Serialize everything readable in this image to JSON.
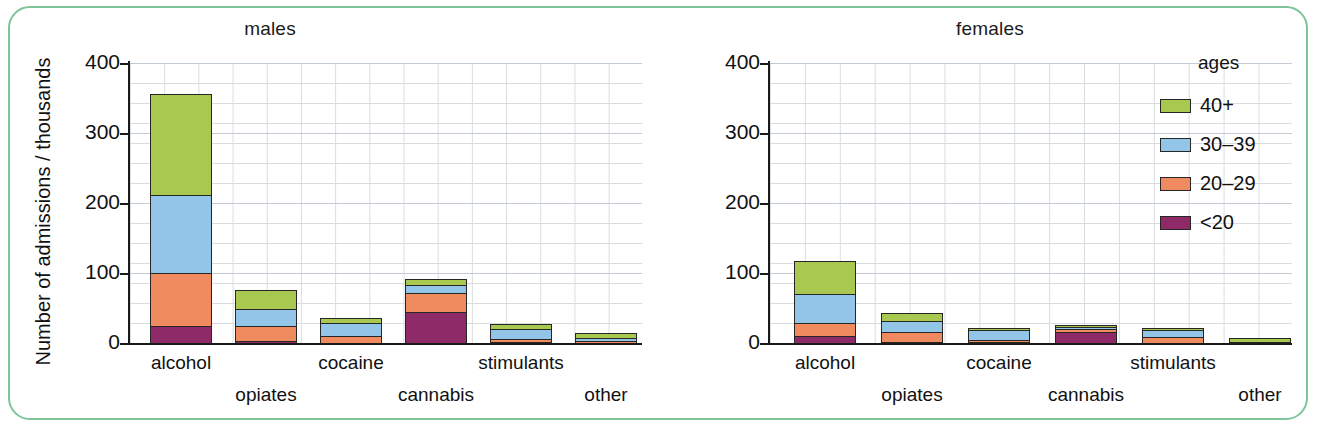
{
  "figure": {
    "y_axis_title": "Number of admissions / thousands",
    "panels": [
      {
        "key": "males",
        "title": "males"
      },
      {
        "key": "females",
        "title": "females"
      }
    ],
    "y_ticks": [
      "0",
      "100",
      "200",
      "300",
      "400"
    ],
    "categories": [
      "alcohol",
      "opiates",
      "cocaine",
      "cannabis",
      "stimulants",
      "other"
    ],
    "legend": {
      "title": "ages",
      "entries": [
        {
          "label": "40+",
          "color": "#a8c84f"
        },
        {
          "label": "30–39",
          "color": "#92c5e8"
        },
        {
          "label": "20–29",
          "color": "#ef8b5e"
        },
        {
          "label": "<20",
          "color": "#8e2a68"
        }
      ]
    },
    "frame_color": "#7ec49a",
    "grid_color": "#d9dde0",
    "major_grid_color": "#c3ccd4",
    "outline_color": "#262626"
  },
  "chart_data": {
    "type": "bar",
    "subtype": "stacked",
    "xlabel": "",
    "ylabel": "Number of admissions / thousands",
    "ylim": [
      0,
      400
    ],
    "yticks": [
      0,
      100,
      200,
      300,
      400
    ],
    "grid": true,
    "legend_position": "right",
    "legend_title": "ages",
    "categories": [
      "alcohol",
      "opiates",
      "cocaine",
      "cannabis",
      "stimulants",
      "other"
    ],
    "panels": [
      {
        "name": "males",
        "series": [
          {
            "name": "<20",
            "color": "#8e2a68",
            "values": [
              27,
              5,
              3,
              47,
              4,
              3
            ]
          },
          {
            "name": "20–29",
            "color": "#ef8b5e",
            "values": [
              78,
              24,
              11,
              29,
              7,
              5
            ]
          },
          {
            "name": "30–39",
            "color": "#92c5e8",
            "values": [
              113,
              27,
              22,
              14,
              16,
              6
            ]
          },
          {
            "name": "40+",
            "color": "#a8c84f",
            "values": [
              147,
              29,
              9,
              10,
              9,
              9
            ]
          }
        ],
        "totals": [
          365,
          85,
          45,
          100,
          36,
          23
        ]
      },
      {
        "name": "females",
        "series": [
          {
            "name": "<20",
            "color": "#8e2a68",
            "values": [
              13,
              4,
              4,
              18,
              3,
              3
            ]
          },
          {
            "name": "20–29",
            "color": "#ef8b5e",
            "values": [
              20,
              16,
              5,
              7,
              10,
              3
            ]
          },
          {
            "name": "30–39",
            "color": "#92c5e8",
            "values": [
              44,
              19,
              17,
              5,
              12,
              3
            ]
          },
          {
            "name": "40+",
            "color": "#a8c84f",
            "values": [
              49,
              13,
              5,
              5,
              6,
              7
            ]
          }
        ],
        "totals": [
          126,
          52,
          31,
          35,
          31,
          16
        ]
      }
    ]
  }
}
